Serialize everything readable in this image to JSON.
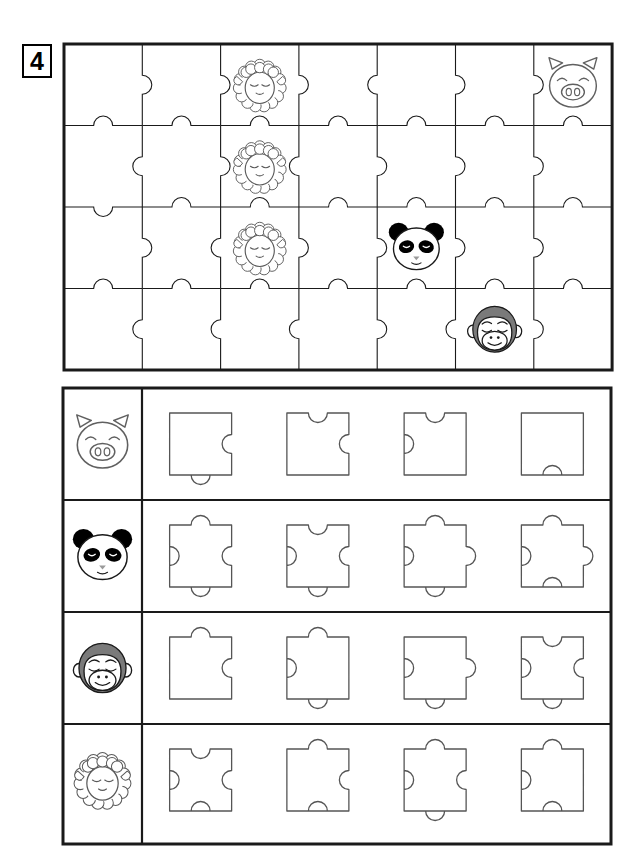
{
  "worksheet": {
    "exercise_number": "4",
    "title_icon": "number-badge",
    "stroke_color": "#1a1a1a",
    "background_color": "#ffffff"
  },
  "board": {
    "name": "puzzle-board",
    "columns": 7,
    "rows": 4,
    "x": 2,
    "y": 2,
    "cell_width": 78.3,
    "cell_height": 81.5,
    "frame_stroke": 3,
    "grid_stroke": 1.1,
    "knob_radius": 9.5,
    "placed_animals": [
      {
        "name": "sheep",
        "row": 0,
        "col": 2
      },
      {
        "name": "pig",
        "row": 0,
        "col": 6
      },
      {
        "name": "sheep",
        "row": 1,
        "col": 2
      },
      {
        "name": "sheep",
        "row": 2,
        "col": 2
      },
      {
        "name": "panda",
        "row": 2,
        "col": 4
      },
      {
        "name": "monkey",
        "row": 3,
        "col": 5
      }
    ],
    "vertical_edges": [
      [
        1,
        1,
        1,
        -1,
        1,
        1
      ],
      [
        -1,
        1,
        -1,
        1,
        1,
        1
      ],
      [
        1,
        -1,
        1,
        1,
        1,
        1
      ],
      [
        -1,
        -1,
        -1,
        1,
        -1,
        1
      ]
    ],
    "horizontal_edges": [
      [
        -1,
        -1,
        -1,
        -1,
        -1,
        -1,
        -1
      ],
      [
        1,
        -1,
        -1,
        -1,
        -1,
        -1,
        -1
      ],
      [
        -1,
        -1,
        -1,
        -1,
        -1,
        -1,
        -1
      ]
    ]
  },
  "tray": {
    "name": "answer-tray",
    "x": 2,
    "y": 2,
    "width": 548,
    "height": 456,
    "label_column_width": 79,
    "row_height": 112,
    "frame_stroke": 3,
    "divider_stroke": 2.2,
    "piece_stroke": 1.3,
    "piece_size": 62,
    "knob_radius": 9.5,
    "rows": [
      {
        "animal": "pig",
        "label_name": "tray-label-pig",
        "pieces": [
          {
            "top": 0,
            "right": -1,
            "bottom": 1,
            "left": 0
          },
          {
            "top": -1,
            "right": -1,
            "bottom": 0,
            "left": 0
          },
          {
            "top": -1,
            "right": 0,
            "bottom": 0,
            "left": -1
          },
          {
            "top": 0,
            "right": 0,
            "bottom": -1,
            "left": 0
          }
        ]
      },
      {
        "animal": "panda",
        "label_name": "tray-label-panda",
        "pieces": [
          {
            "top": 1,
            "right": -1,
            "bottom": 1,
            "left": -1
          },
          {
            "top": -1,
            "right": -1,
            "bottom": 1,
            "left": -1
          },
          {
            "top": 1,
            "right": 1,
            "bottom": 1,
            "left": -1
          },
          {
            "top": 1,
            "right": 1,
            "bottom": -1,
            "left": -1
          }
        ]
      },
      {
        "animal": "monkey",
        "label_name": "tray-label-monkey",
        "pieces": [
          {
            "top": 1,
            "right": -1,
            "bottom": 0,
            "left": 0
          },
          {
            "top": 1,
            "right": 0,
            "bottom": 1,
            "left": -1
          },
          {
            "top": 0,
            "right": 1,
            "bottom": 1,
            "left": -1
          },
          {
            "top": -1,
            "right": -1,
            "bottom": 1,
            "left": -1
          }
        ]
      },
      {
        "animal": "sheep",
        "label_name": "tray-label-sheep",
        "pieces": [
          {
            "top": -1,
            "right": -1,
            "bottom": -1,
            "left": -1
          },
          {
            "top": 1,
            "right": -1,
            "bottom": -1,
            "left": 0
          },
          {
            "top": 1,
            "right": -1,
            "bottom": 1,
            "left": -1
          },
          {
            "top": 1,
            "right": 0,
            "bottom": -1,
            "left": -1
          }
        ]
      }
    ]
  },
  "animals": {
    "pig": {
      "label": "pig-face-icon",
      "fill": "#ffffff",
      "stroke": "#555555"
    },
    "panda": {
      "label": "panda-face-icon",
      "fill": "#ffffff",
      "stroke": "#1a1a1a",
      "accent": "#000000"
    },
    "monkey": {
      "label": "monkey-face-icon",
      "fill": "#ffffff",
      "stroke": "#1a1a1a",
      "accent": "#777777"
    },
    "sheep": {
      "label": "sheep-face-icon",
      "fill": "#ffffff",
      "stroke": "#555555"
    }
  }
}
